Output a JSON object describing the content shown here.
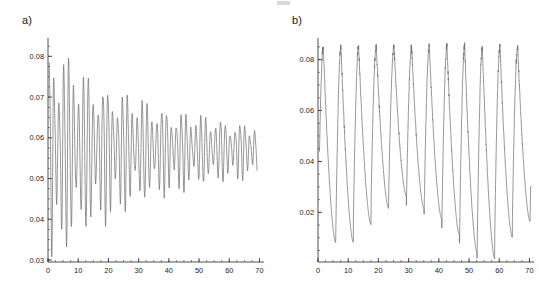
{
  "figure": {
    "background": "#ffffff",
    "line_color": "#6e6e6e",
    "axis_color": "#3a3a3a",
    "artifact_label": "crop-artifact"
  },
  "panels": [
    {
      "id": "panel-a",
      "label": "a)",
      "label_x": 22,
      "label_y": 22,
      "axes": {
        "x_min": 0,
        "x_max": 71.5,
        "y_min": 0.0295,
        "y_max": 0.0845,
        "x_ticks": [
          0,
          10,
          20,
          30,
          40,
          50,
          60,
          70
        ],
        "x_tick_labels": [
          "0",
          "10",
          "20",
          "30",
          "40",
          "50",
          "60",
          "70"
        ],
        "y_ticks": [
          0.03,
          0.04,
          0.05,
          0.06,
          0.07,
          0.08
        ],
        "y_tick_labels": [
          "0.03",
          "0.04",
          "0.05",
          "0.06",
          "0.07",
          "0.08"
        ],
        "x_minor_step": 2.5,
        "y_minor_step": 0.0025,
        "grid": false,
        "xlabel": "",
        "ylabel": ""
      },
      "plot_rect": {
        "left": 48,
        "top": 38,
        "width": 216,
        "height": 224
      }
    },
    {
      "id": "panel-b",
      "label": "b)",
      "label_x": 292,
      "label_y": 22,
      "axes": {
        "x_min": 0,
        "x_max": 71.5,
        "y_min": 0.0005,
        "y_max": 0.0885,
        "x_ticks": [
          0,
          10,
          20,
          30,
          40,
          50,
          60,
          70
        ],
        "x_tick_labels": [
          "0",
          "10",
          "20",
          "30",
          "40",
          "50",
          "60",
          "70"
        ],
        "y_ticks": [
          0.02,
          0.04,
          0.06,
          0.08
        ],
        "y_tick_labels": [
          "0.02",
          "0.04",
          "0.06",
          "0.08"
        ],
        "x_minor_step": 2.5,
        "y_minor_step": 0.005,
        "grid": false,
        "xlabel": "",
        "ylabel": ""
      },
      "plot_rect": {
        "left": 318,
        "top": 38,
        "width": 216,
        "height": 224
      }
    }
  ],
  "chart_data": [
    {
      "type": "line",
      "title": "a)",
      "xlabel": "",
      "ylabel": "",
      "xlim": [
        0,
        71.5
      ],
      "ylim": [
        0.0295,
        0.0845
      ],
      "grid": false,
      "legend": "none",
      "description": "Damped beating oscillation: fast oscillation whose envelope collapses from a wide spread (0.030-0.083) toward a steady value near 0.057.",
      "series": [
        {
          "name": "a-signal",
          "baseline": 0.0572,
          "envelope_start": 0.0262,
          "envelope_end": 0.0035,
          "envelope_decay_rate": 0.031,
          "fast_period": 1.62,
          "beat_period": 6.4,
          "beat_depth": 0.62,
          "asymmetry": 0.12,
          "t_start": 0.4,
          "t_end": 69.2,
          "samples": 1400,
          "extrema_markers": {
            "max_value": 0.0832,
            "max_time": 1.6,
            "min_value": 0.0302,
            "min_time": 5.0
          }
        }
      ]
    },
    {
      "type": "line",
      "title": "b)",
      "xlabel": "",
      "ylabel": "",
      "xlim": [
        0,
        71.5
      ],
      "ylim": [
        0.0005,
        0.0885
      ],
      "grid": false,
      "legend": "none",
      "description": "Sustained relaxation oscillation: 12 large cycles with rounded peaks near 0.085 and sharp narrow troughs whose depth varies between 0.027 and 0.003.",
      "series": [
        {
          "name": "b-signal",
          "peak_value": 0.0852,
          "peak_jitter": 0.0016,
          "trough_base": 0.0125,
          "trough_jitter": 0.011,
          "period": 5.85,
          "rise_fraction": 0.3,
          "peak_sharpness": 2.4,
          "trough_sharpness": 3.1,
          "t_start": 0.5,
          "t_end": 70.4,
          "samples": 1600,
          "trough_times": [
            6.1,
            12.0,
            17.9,
            23.6,
            29.2,
            35.0,
            40.8,
            46.7,
            52.8,
            59.3,
            65.2
          ],
          "trough_values": [
            0.0082,
            0.0152,
            0.0215,
            0.0265,
            0.0215,
            0.0175,
            0.0112,
            0.0042,
            0.0018,
            0.0102,
            0.0165
          ]
        }
      ]
    }
  ]
}
